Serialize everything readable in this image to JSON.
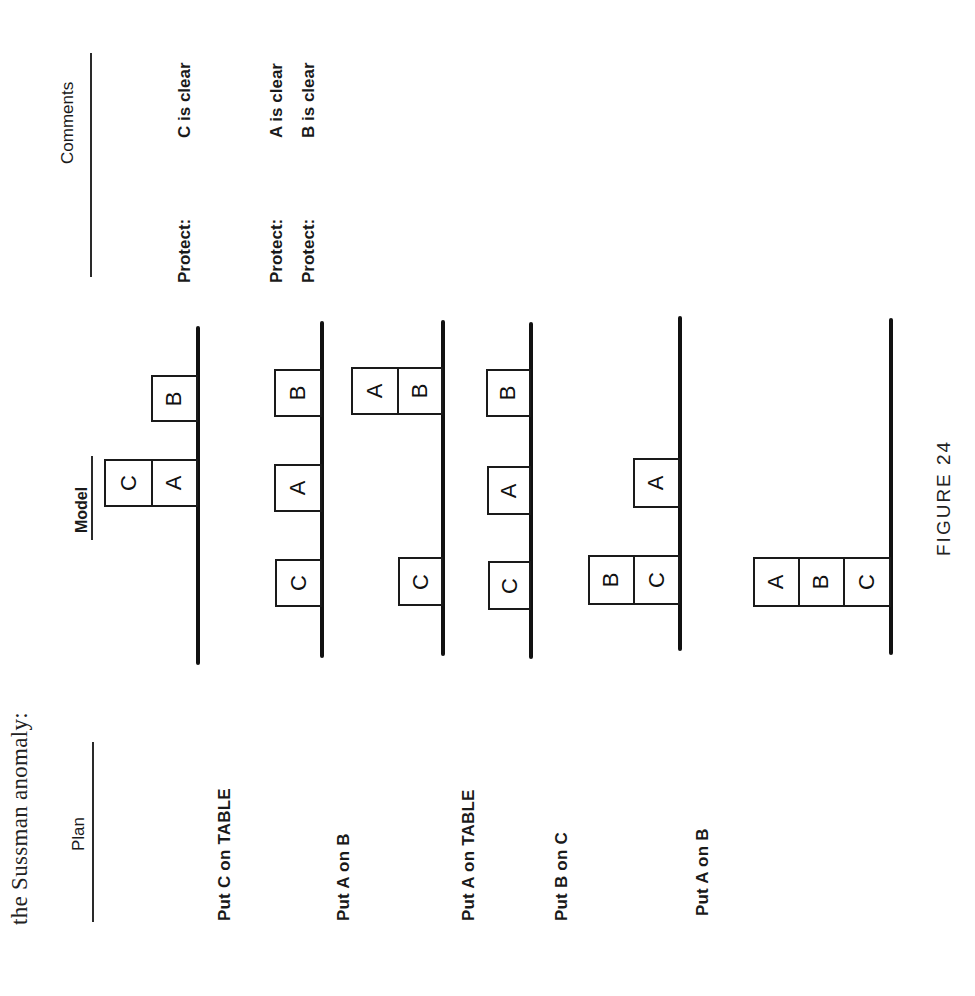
{
  "intro_text": "the Sussman anomaly:",
  "headers": {
    "plan": "Plan",
    "model": "Model",
    "comments": "Comments"
  },
  "rows": [
    {
      "plan": "Put C on TABLE",
      "model": {
        "stacks": [
          [
            "A",
            "C"
          ],
          [
            "B"
          ]
        ]
      },
      "comments": [
        {
          "label": "Protect:",
          "value": "C is clear"
        }
      ]
    },
    {
      "plan": "Put A on B",
      "model": {
        "stacks": [
          [
            "C"
          ],
          [
            "A"
          ],
          [
            "B"
          ]
        ]
      },
      "comments": [
        {
          "label": "Protect:",
          "value": "A is clear"
        },
        {
          "label": "Protect:",
          "value": "B is clear"
        }
      ]
    },
    {
      "plan": "Put A on TABLE",
      "model": {
        "stacks": [
          [
            "C"
          ],
          [
            "B",
            "A"
          ]
        ]
      },
      "comments": []
    },
    {
      "plan": "Put B on C",
      "model": {
        "stacks": [
          [
            "C"
          ],
          [
            "A"
          ],
          [
            "B"
          ]
        ]
      },
      "comments": []
    },
    {
      "plan": "Put A on B",
      "model": {
        "stacks": [
          [
            "C",
            "B"
          ],
          [
            "A"
          ]
        ]
      },
      "comments": []
    },
    {
      "plan": "",
      "model": {
        "stacks": [
          [
            "C",
            "B",
            "A"
          ]
        ]
      },
      "comments": []
    }
  ],
  "caption": "FIGURE 24"
}
